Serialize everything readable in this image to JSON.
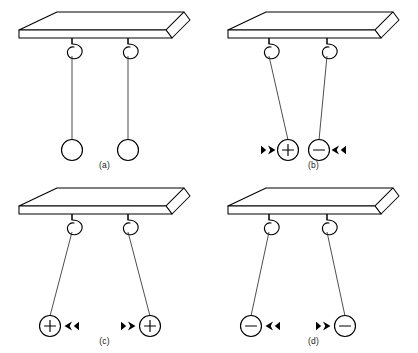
{
  "figure": {
    "background_color": "#ffffff",
    "line_color": "#000000",
    "width": 418,
    "height": 353
  },
  "panels": [
    {
      "id": "a",
      "caption": "(a)",
      "description": "Two uncharged balls hang straight down from hooks",
      "balls": [
        {
          "charge": "",
          "charge_symbol": "none",
          "arrow": "none",
          "string_tilt": "vertical"
        },
        {
          "charge": "",
          "charge_symbol": "none",
          "arrow": "none",
          "string_tilt": "vertical"
        }
      ]
    },
    {
      "id": "b",
      "caption": "(b)",
      "description": "Opposite charges attract; strings tilt inward toward each other",
      "balls": [
        {
          "charge": "+",
          "charge_symbol": "plus",
          "arrow": "right",
          "string_tilt": "inward"
        },
        {
          "charge": "−",
          "charge_symbol": "minus",
          "arrow": "left",
          "string_tilt": "inward"
        }
      ]
    },
    {
      "id": "c",
      "caption": "(c)",
      "description": "Like positive charges repel; strings tilt outward away from each other",
      "balls": [
        {
          "charge": "+",
          "charge_symbol": "plus",
          "arrow": "left",
          "string_tilt": "outward"
        },
        {
          "charge": "+",
          "charge_symbol": "plus",
          "arrow": "right",
          "string_tilt": "outward"
        }
      ]
    },
    {
      "id": "d",
      "caption": "(d)",
      "description": "Like negative charges repel; strings tilt outward away from each other",
      "balls": [
        {
          "charge": "−",
          "charge_symbol": "minus",
          "arrow": "left",
          "string_tilt": "outward"
        },
        {
          "charge": "−",
          "charge_symbol": "minus",
          "arrow": "right",
          "string_tilt": "outward"
        }
      ]
    }
  ]
}
